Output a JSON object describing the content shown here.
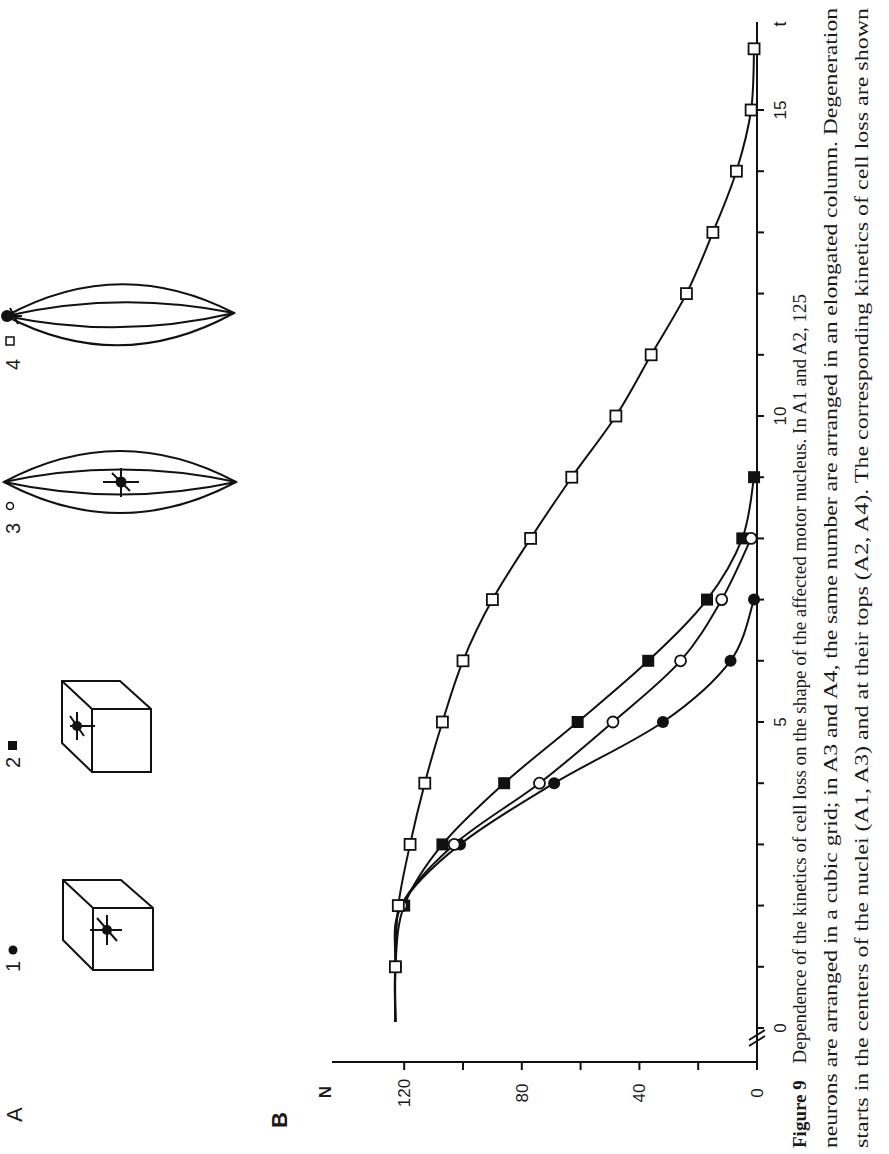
{
  "panel_labels": {
    "a": "A",
    "b": "B"
  },
  "panel_a": {
    "items": [
      {
        "index": "1",
        "marker": "filled-circle",
        "shape": "cube",
        "nucleus_position": "center"
      },
      {
        "index": "2",
        "marker": "filled-square",
        "shape": "cube",
        "nucleus_position": "top"
      },
      {
        "index": "3",
        "marker": "open-circle",
        "shape": "elongated-column",
        "nucleus_position": "center"
      },
      {
        "index": "4",
        "marker": "open-square",
        "shape": "elongated-column",
        "nucleus_position": "top"
      }
    ]
  },
  "caption": {
    "figure_label": "Figure 9",
    "lines": [
      "Dependence of the kinetics of cell loss on the shape of the affected motor nucleus. In A1 and A2, 125",
      "neurons are arranged in a cubic grid; in A3 and A4, the same number are arranged in an elongated column. Degeneration",
      "starts in the centers of the nuclei (A1, A3) and at their tops (A2, A4). The corresponding kinetics of cell loss are shown"
    ]
  },
  "chart_data": {
    "type": "line",
    "title": "",
    "xlabel": "t",
    "ylabel": "N",
    "xlim": [
      0,
      16.5
    ],
    "ylim": [
      0,
      130
    ],
    "x_ticks": [
      0,
      1,
      2,
      3,
      4,
      5,
      6,
      7,
      8,
      9,
      10,
      11,
      12,
      13,
      14,
      15
    ],
    "x_tick_labels": [
      "0",
      "",
      "",
      "",
      "",
      "5",
      "",
      "",
      "",
      "",
      "10",
      "",
      "",
      "",
      "",
      "15"
    ],
    "y_ticks": [
      0,
      20,
      40,
      60,
      80,
      100,
      120
    ],
    "y_tick_labels": [
      "0",
      "",
      "40",
      "",
      "80",
      "",
      "120"
    ],
    "axis_break": "x-axis near origin (//)",
    "grid": false,
    "orientation": "page rotated 90° counter-clockwise",
    "series": [
      {
        "name": "1 (cube, center)",
        "marker": "filled-circle",
        "x": [
          0,
          1,
          2,
          3,
          4,
          5,
          6,
          7
        ],
        "y": [
          123,
          123,
          121,
          101,
          69,
          32,
          9,
          1
        ]
      },
      {
        "name": "2 (cube, top)",
        "marker": "filled-square",
        "x": [
          0,
          1,
          2,
          3,
          4,
          5,
          6,
          7,
          8,
          9
        ],
        "y": [
          123,
          123,
          120,
          107,
          86,
          61,
          37,
          17,
          5,
          1
        ]
      },
      {
        "name": "3 (column, center)",
        "marker": "open-circle",
        "x": [
          0,
          1,
          2,
          3,
          4,
          5,
          6,
          7,
          8
        ],
        "y": [
          123,
          123,
          121,
          103,
          74,
          49,
          26,
          12,
          2
        ]
      },
      {
        "name": "4 (column, top)",
        "marker": "open-square",
        "x": [
          0,
          1,
          2,
          3,
          4,
          5,
          6,
          7,
          8,
          9,
          10,
          11,
          12,
          13,
          14,
          15,
          16
        ],
        "y": [
          123,
          123,
          122,
          118,
          113,
          107,
          100,
          90,
          77,
          63,
          48,
          36,
          24,
          15,
          7,
          2,
          1
        ]
      }
    ]
  }
}
